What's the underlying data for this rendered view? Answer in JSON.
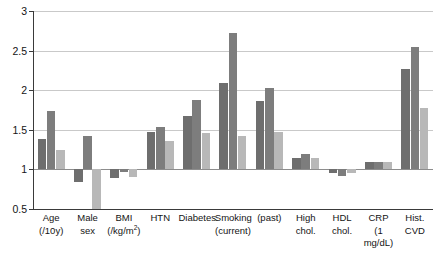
{
  "chart_data": {
    "type": "bar",
    "title": "",
    "subtitle": "",
    "xlabel": "",
    "ylabel": "",
    "ylim": [
      0.5,
      3
    ],
    "yticks": [
      0.5,
      1,
      1.5,
      2,
      2.5,
      3
    ],
    "ytick_labels": [
      "0.5",
      "1",
      "1.5",
      "2",
      "2.5",
      "3"
    ],
    "grid": true,
    "reference_line": 1,
    "legend_position": "top-center",
    "categories": [
      "Age (/10y)",
      "Male sex",
      "BMI (/kg/m2)",
      "HTN",
      "Diabetes",
      "Smoking (current)",
      "Smoking (past)",
      "High chol.",
      "HDL chol.",
      "CRP (1 mg/dL)",
      "Hist. CVD"
    ],
    "category_lines": [
      {
        "l1": "Age",
        "l2": "(/10y)",
        "sup": ""
      },
      {
        "l1": "Male",
        "l2": "sex",
        "sup": ""
      },
      {
        "l1": "BMI",
        "l2": "(/kg/m",
        "sup": "2"
      },
      {
        "l1": "HTN",
        "l2": "",
        "sup": ""
      },
      {
        "l1": "Diabetes",
        "l2": "",
        "sup": ""
      },
      {
        "l1": "Smoking",
        "l2": "(current)",
        "sup": ""
      },
      {
        "l1": "",
        "l2": "(past)",
        "sup": ""
      },
      {
        "l1": "High",
        "l2": "chol.",
        "sup": ""
      },
      {
        "l1": "HDL",
        "l2": "chol.",
        "sup": ""
      },
      {
        "l1": "CRP",
        "l2": "(1 mg/dL)",
        "sup": ""
      },
      {
        "l1": "Hist.",
        "l2": "CVD",
        "sup": ""
      }
    ],
    "series": [
      {
        "name": "OR (Global)",
        "color": "#6e6e6e",
        "values": [
          1.38,
          0.84,
          0.89,
          1.47,
          1.67,
          2.09,
          1.87,
          1.15,
          0.95,
          1.1,
          2.27
        ]
      },
      {
        "name": "OR (HIC)",
        "color": "#7d7d7d",
        "values": [
          1.74,
          1.42,
          0.97,
          1.54,
          1.88,
          2.72,
          2.03,
          1.19,
          0.92,
          1.1,
          2.55
        ]
      },
      {
        "name": "OR (LMIC)",
        "color": "#b8b8b8",
        "values": [
          1.24,
          0.3,
          0.9,
          1.36,
          1.46,
          1.42,
          1.47,
          1.14,
          0.96,
          1.1,
          1.77
        ]
      }
    ]
  },
  "legend": {
    "items": [
      {
        "label": "OR (Global)",
        "color": "#6e6e6e"
      },
      {
        "label": "OR (HIC)",
        "color": "#7d7d7d"
      },
      {
        "label": "OR (LMIC)",
        "color": "#b8b8b8"
      }
    ]
  }
}
